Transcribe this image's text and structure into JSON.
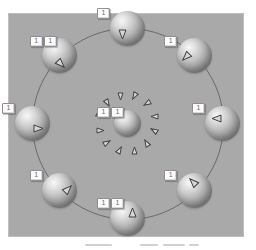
{
  "figure": {
    "background": "#ffffff",
    "panel_color": "#a9a9a9",
    "orbit_stroke": "#5d5d5d"
  },
  "viewport": {
    "x": 8,
    "y": 13,
    "w": 236,
    "h": 224
  },
  "orbit": {
    "cx": 119,
    "cy": 110,
    "r": 95
  },
  "central_body": {
    "name": "central-sphere",
    "cx": 119,
    "cy": 110,
    "d": 27,
    "tag_label": "1",
    "tag_cells": 2,
    "vector_ring": {
      "count": 12,
      "radius": 27,
      "marker_w": 9,
      "marker_h": 7,
      "fill": "#d6d6d6",
      "stroke": "#404040"
    }
  },
  "satellite_style": {
    "d": 35,
    "marker_w": 11,
    "marker_h": 9,
    "fill": "#d6d6d6",
    "stroke": "#404040"
  },
  "satellites": [
    {
      "name": "sphere-top",
      "angle_deg": 270,
      "tag_label": "1",
      "tag_cells": 1
    },
    {
      "name": "sphere-upper-right",
      "angle_deg": 315,
      "tag_label": "1",
      "tag_cells": 1
    },
    {
      "name": "sphere-right",
      "angle_deg": 0,
      "tag_label": "1",
      "tag_cells": 1
    },
    {
      "name": "sphere-lower-right",
      "angle_deg": 45,
      "tag_label": "1",
      "tag_cells": 1
    },
    {
      "name": "sphere-bottom",
      "angle_deg": 90,
      "tag_label": "1",
      "tag_cells": 2
    },
    {
      "name": "sphere-lower-left",
      "angle_deg": 135,
      "tag_label": "1",
      "tag_cells": 1
    },
    {
      "name": "sphere-left",
      "angle_deg": 180,
      "tag_label": "1",
      "tag_cells": 1
    },
    {
      "name": "sphere-upper-left",
      "angle_deg": 225,
      "tag_label": "1",
      "tag_cells": 2
    }
  ],
  "caption_remnant": {
    "y": 244,
    "segments": [
      {
        "x": 85,
        "w": 27
      },
      {
        "x": 140,
        "w": 18
      },
      {
        "x": 163,
        "w": 22
      },
      {
        "x": 189,
        "w": 10
      }
    ]
  }
}
